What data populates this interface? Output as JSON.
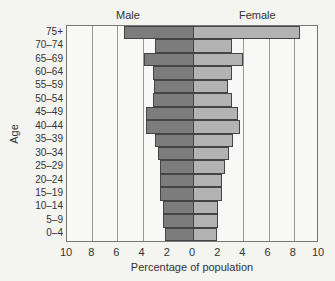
{
  "chart_data": {
    "type": "bar",
    "orientation": "horizontal",
    "subtype": "population-pyramid",
    "title": "",
    "xlabel": "Percentage of population",
    "ylabel": "Age",
    "xlim": [
      -10,
      10
    ],
    "xticks": [
      10,
      8,
      6,
      4,
      2,
      0,
      2,
      4,
      6,
      8,
      10
    ],
    "grid": "vertical",
    "categories": [
      "0–4",
      "5–9",
      "10–14",
      "15–19",
      "20–24",
      "25–29",
      "30–34",
      "35–39",
      "40–44",
      "45–49",
      "50–54",
      "55–59",
      "60–64",
      "65–69",
      "70–74",
      "75+"
    ],
    "series": [
      {
        "name": "Male",
        "color": "#7c7c7c",
        "values": [
          2.2,
          2.4,
          2.4,
          2.6,
          2.6,
          2.6,
          2.8,
          3.0,
          3.7,
          3.7,
          3.2,
          3.1,
          3.2,
          3.9,
          3.0,
          5.5
        ]
      },
      {
        "name": "Female",
        "color": "#b3b3b3",
        "values": [
          1.9,
          2.0,
          2.0,
          2.3,
          2.3,
          2.5,
          2.85,
          3.2,
          3.75,
          3.6,
          3.1,
          2.8,
          3.1,
          4.0,
          3.1,
          8.5
        ]
      }
    ],
    "legend": {
      "left": "Male",
      "right": "Female",
      "position": "top"
    }
  },
  "labels": {
    "male": "Male",
    "female": "Female",
    "xlabel": "Percentage of population",
    "ylabel": "Age"
  }
}
